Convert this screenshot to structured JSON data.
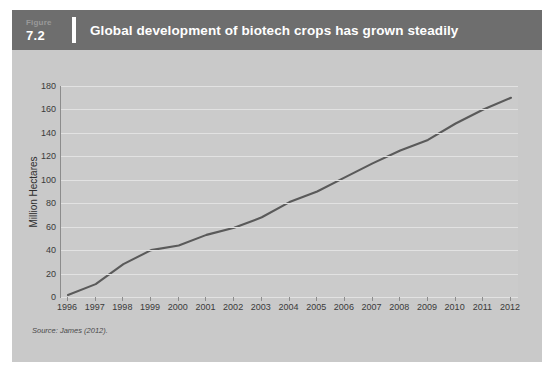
{
  "figure": {
    "label_word": "Figure",
    "number": "7.2",
    "title": "Global development of biotech crops has grown steadily",
    "source_note": "Source: James (2012)."
  },
  "colors": {
    "header_bar": "#6e6e6e",
    "panel_background": "#c9c9c9",
    "plot_background": "#cbcbcb",
    "gridline": "#e2e2e2",
    "line_series": "#5a5a5a",
    "axis": "#8c8c8c",
    "title_text": "#ffffff"
  },
  "chart_data": {
    "type": "line",
    "title": "Global development of biotech crops has grown steadily",
    "xlabel": "",
    "ylabel": "Million Hectares",
    "ylim": [
      0,
      180
    ],
    "yticks": [
      0,
      20,
      40,
      60,
      80,
      100,
      120,
      140,
      160,
      180
    ],
    "grid": true,
    "legend": "none",
    "categories": [
      "1996",
      "1997",
      "1998",
      "1999",
      "2000",
      "2001",
      "2002",
      "2003",
      "2004",
      "2005",
      "2006",
      "2007",
      "2008",
      "2009",
      "2010",
      "2011",
      "2012"
    ],
    "x": [
      1996,
      1997,
      1998,
      1999,
      2000,
      2001,
      2002,
      2003,
      2004,
      2005,
      2006,
      2007,
      2008,
      2009,
      2010,
      2011,
      2012
    ],
    "values": [
      1.7,
      11,
      28,
      40,
      44,
      53,
      59,
      68,
      81,
      90,
      102,
      114,
      125,
      134,
      148,
      160,
      170
    ],
    "series": [
      {
        "name": "Global biotech crop area",
        "values": [
          1.7,
          11,
          28,
          40,
          44,
          53,
          59,
          68,
          81,
          90,
          102,
          114,
          125,
          134,
          148,
          160,
          170
        ]
      }
    ]
  }
}
